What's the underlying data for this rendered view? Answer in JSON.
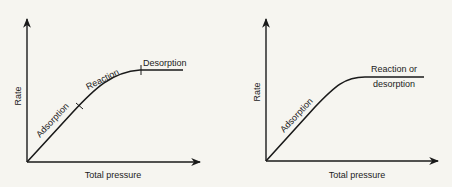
{
  "diagrams": [
    {
      "id": "left",
      "x_axis_label": "Total pressure",
      "y_axis_label": "Rate",
      "segments": [
        "Adsorption",
        "Reaction",
        "Desorption"
      ]
    },
    {
      "id": "right",
      "x_axis_label": "Total pressure",
      "y_axis_label": "Rate",
      "segments": [
        "Adsorption",
        "Reaction or",
        "desorption"
      ]
    }
  ]
}
